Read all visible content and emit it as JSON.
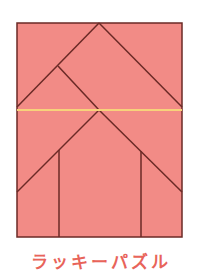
{
  "caption": "ラッキーパズル",
  "colors": {
    "fill": "#f28b86",
    "stroke": "#6b2a26",
    "highlight": "#f7d27a",
    "caption": "#e8645a"
  },
  "puzzle": {
    "frame": {
      "x": 17,
      "y": 23,
      "width": 165,
      "height": 214
    },
    "lines": [
      {
        "name": "upper-left-diagonal",
        "x1": 99,
        "y1": 23,
        "x2": 17,
        "y2": 107
      },
      {
        "name": "upper-right-diagonal",
        "x1": 99,
        "y1": 23,
        "x2": 182,
        "y2": 107
      },
      {
        "name": "inner-diagonal",
        "x1": 58,
        "y1": 66,
        "x2": 99,
        "y2": 110
      },
      {
        "name": "lower-left-diagonal",
        "x1": 99,
        "y1": 110,
        "x2": 17,
        "y2": 192
      },
      {
        "name": "lower-right-diagonal",
        "x1": 99,
        "y1": 110,
        "x2": 182,
        "y2": 192
      },
      {
        "name": "left-vertical",
        "x1": 59,
        "y1": 150,
        "x2": 59,
        "y2": 237
      },
      {
        "name": "right-vertical",
        "x1": 141,
        "y1": 151,
        "x2": 141,
        "y2": 237
      }
    ],
    "highlight_line": {
      "x1": 17,
      "y1": 110,
      "x2": 182,
      "y2": 110
    }
  }
}
